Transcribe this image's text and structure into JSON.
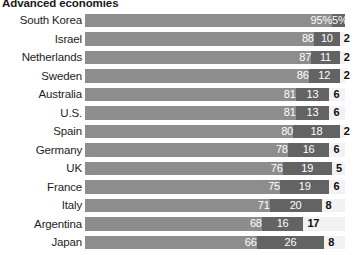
{
  "chart_data": {
    "type": "bar",
    "title": "Advanced economies",
    "subtitle": "",
    "xlabel": "",
    "ylabel": "",
    "xlim": [
      0,
      100
    ],
    "grid": false,
    "legend_position": "none",
    "orientation": "horizontal",
    "stacked": true,
    "categories": [
      "South Korea",
      "Israel",
      "Netherlands",
      "Sweden",
      "Australia",
      "U.S.",
      "Spain",
      "Germany",
      "UK",
      "France",
      "Italy",
      "Argentina",
      "Japan"
    ],
    "series": [
      {
        "name": "segment-1",
        "color": "#8d8d8d",
        "values": [
          95,
          88,
          87,
          86,
          81,
          81,
          80,
          78,
          76,
          75,
          71,
          68,
          66
        ]
      },
      {
        "name": "segment-2",
        "color": "#636363",
        "values": [
          5,
          10,
          11,
          12,
          13,
          13,
          18,
          16,
          19,
          19,
          20,
          16,
          26
        ]
      },
      {
        "name": "segment-3",
        "color": "#f2f2f2",
        "values": [
          null,
          2,
          2,
          2,
          6,
          6,
          2,
          6,
          5,
          6,
          8,
          17,
          8
        ]
      }
    ],
    "value_labels": [
      {
        "category": "South Korea",
        "a": "95%",
        "b": "5%",
        "c": ""
      },
      {
        "category": "Israel",
        "a": "88",
        "b": "10",
        "c": "2"
      },
      {
        "category": "Netherlands",
        "a": "87",
        "b": "11",
        "c": "2"
      },
      {
        "category": "Sweden",
        "a": "86",
        "b": "12",
        "c": "2"
      },
      {
        "category": "Australia",
        "a": "81",
        "b": "13",
        "c": "6"
      },
      {
        "category": "U.S.",
        "a": "81",
        "b": "13",
        "c": "6"
      },
      {
        "category": "Spain",
        "a": "80",
        "b": "18",
        "c": "2"
      },
      {
        "category": "Germany",
        "a": "78",
        "b": "16",
        "c": "6"
      },
      {
        "category": "UK",
        "a": "76",
        "b": "19",
        "c": "5"
      },
      {
        "category": "France",
        "a": "75",
        "b": "19",
        "c": "6"
      },
      {
        "category": "Italy",
        "a": "71",
        "b": "20",
        "c": "8"
      },
      {
        "category": "Argentina",
        "a": "68",
        "b": "16",
        "c": "17"
      },
      {
        "category": "Japan",
        "a": "66",
        "b": "26",
        "c": "8"
      }
    ],
    "colors": {
      "segment_1": "#8d8d8d",
      "segment_2": "#636363",
      "track": "#f2f2f2",
      "label_text": "#1d1d1d",
      "inbar_text": "#ffffff",
      "outer_value_text": "#0d0d0d",
      "background": "#ffffff"
    }
  }
}
